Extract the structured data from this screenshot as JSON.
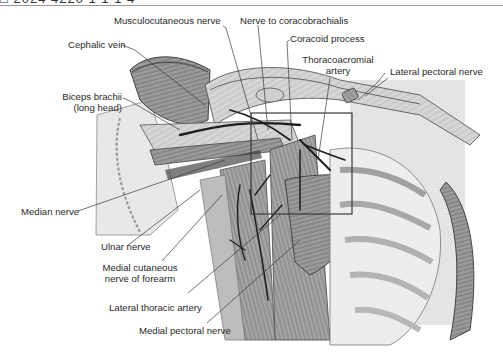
{
  "header": {
    "text": "□ 2024 4220 1 1 1 4"
  },
  "figure": {
    "labels": [
      {
        "id": "musculocutaneous-nerve",
        "text": "Musculocutaneous nerve"
      },
      {
        "id": "nerve-to-coracobrachialis",
        "text": "Nerve to coracobrachialis"
      },
      {
        "id": "cephalic-vein",
        "text": "Cephalic vein"
      },
      {
        "id": "coracoid-process",
        "text": "Coracoid process"
      },
      {
        "id": "thoracoacromial-artery",
        "line1": "Thoracoacromial",
        "line2": "artery"
      },
      {
        "id": "lateral-pectoral-nerve",
        "text": "Lateral pectoral nerve"
      },
      {
        "id": "biceps-brachii-long-head",
        "line1": "Biceps brachii",
        "line2": "(long head)"
      },
      {
        "id": "median-nerve",
        "text": "Median nerve"
      },
      {
        "id": "ulnar-nerve",
        "text": "Ulnar nerve"
      },
      {
        "id": "medial-cutaneous-nerve-forearm",
        "line1": "Medial cutaneous",
        "line2": "nerve of forearm"
      },
      {
        "id": "lateral-thoracic-artery",
        "text": "Lateral thoracic artery"
      },
      {
        "id": "medial-pectoral-nerve",
        "text": "Medial pectoral nerve"
      }
    ]
  },
  "colors": {
    "background": "#ffffff",
    "label_text": "#2a2a2a",
    "leader_line": "#3a3a3a",
    "muscle_dark": "#6e6e6e",
    "muscle_mid": "#a8a8a8",
    "muscle_light": "#dcdcdc",
    "nerve_vessel": "#1e1e1e",
    "skin_bg": "#e4e4e4"
  }
}
